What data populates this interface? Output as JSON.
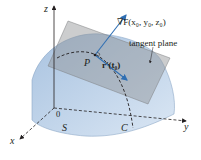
{
  "figure": {
    "labels": {
      "z_axis": "z",
      "x_axis": "x",
      "y_axis": "y",
      "origin": "0",
      "surface": "S",
      "curve": "C",
      "point": "P",
      "tangent_vector": "r′(t₀)",
      "gradient": "∇F(x₀, y₀, z₀)",
      "tangent_plane": "tangent plane"
    },
    "colors": {
      "surface_fill": "#b9cfe6",
      "surface_edge": "#8fa9c8",
      "plane_fill": "#8e9092",
      "arrow": "#2f6fb3",
      "axis": "#231f20",
      "text": "#231f20"
    }
  }
}
